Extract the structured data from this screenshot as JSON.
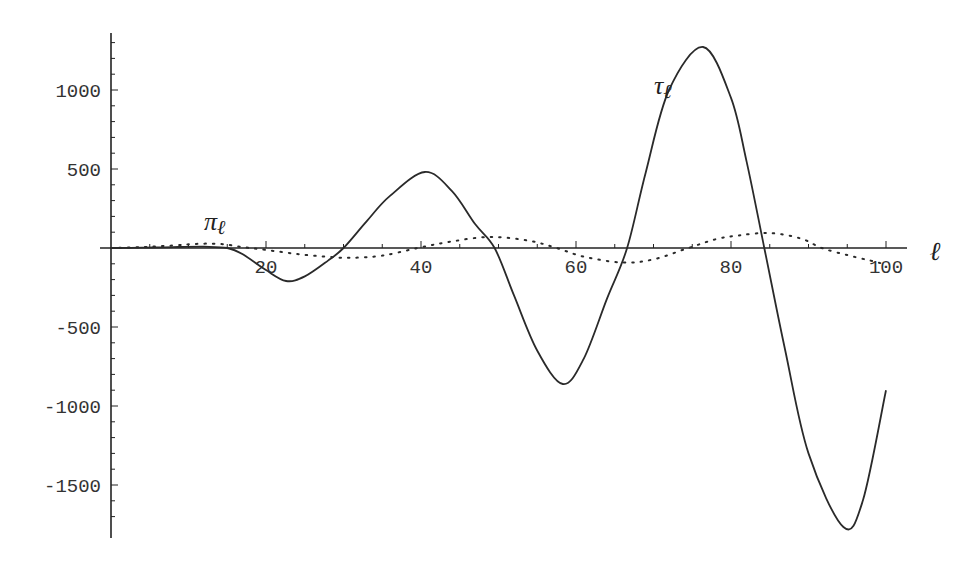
{
  "chart_data": {
    "type": "line",
    "title": "",
    "xlabel": "ℓ",
    "ylabel": "",
    "xlim": [
      0,
      102.5
    ],
    "ylim": [
      -1830,
      1370
    ],
    "grid": false,
    "legend": "none (inline curve labels)",
    "x_ticks": [
      20,
      40,
      60,
      80,
      100
    ],
    "x_tick_labels": [
      "20",
      "40",
      "60",
      "80",
      "100"
    ],
    "y_ticks": [
      1000,
      500,
      -500,
      -1000,
      -1500
    ],
    "y_tick_labels": [
      "1000",
      "500",
      "-500",
      "-1000",
      "-1500"
    ],
    "series": [
      {
        "name": "τℓ",
        "label_symbol": "τ",
        "label_sub": "ℓ",
        "style": "solid",
        "x": [
          0,
          4,
          8,
          12,
          15,
          17,
          20,
          22.6,
          25,
          28,
          30,
          33,
          36,
          40.5,
          44,
          47,
          49.5,
          52,
          55,
          58.3,
          61,
          64,
          66.6,
          69,
          72,
          76.4,
          80,
          82,
          84.3,
          87,
          90,
          94.5,
          97,
          100
        ],
        "values": [
          0,
          2,
          6,
          8,
          0,
          -40,
          -140,
          -209,
          -180,
          -80,
          0,
          170,
          330,
          481,
          360,
          150,
          0,
          -300,
          -650,
          -861,
          -700,
          -320,
          0,
          480,
          1000,
          1272,
          950,
          550,
          0,
          -650,
          -1300,
          -1766,
          -1600,
          -900
        ]
      },
      {
        "name": "πℓ",
        "label_symbol": "π",
        "label_sub": "ℓ",
        "style": "dotted",
        "x": [
          0,
          4,
          8,
          11,
          14,
          17,
          20,
          24,
          28,
          31,
          35,
          39.6,
          44,
          49,
          54,
          57.5,
          61,
          66,
          70,
          74.5,
          78,
          81,
          85,
          89,
          91.7,
          95,
          98,
          100
        ],
        "values": [
          0,
          6,
          16,
          26,
          26,
          6,
          -12,
          -38,
          -56,
          -62,
          -48,
          0,
          42,
          70,
          45,
          0,
          -55,
          -92,
          -72,
          0,
          55,
          80,
          95,
          60,
          0,
          -45,
          -80,
          -105
        ]
      }
    ],
    "annotations": [
      {
        "text": "τℓ",
        "near_x": 72,
        "near_y": 980
      },
      {
        "text": "πℓ",
        "near_x": 12,
        "near_y": 110
      }
    ]
  }
}
